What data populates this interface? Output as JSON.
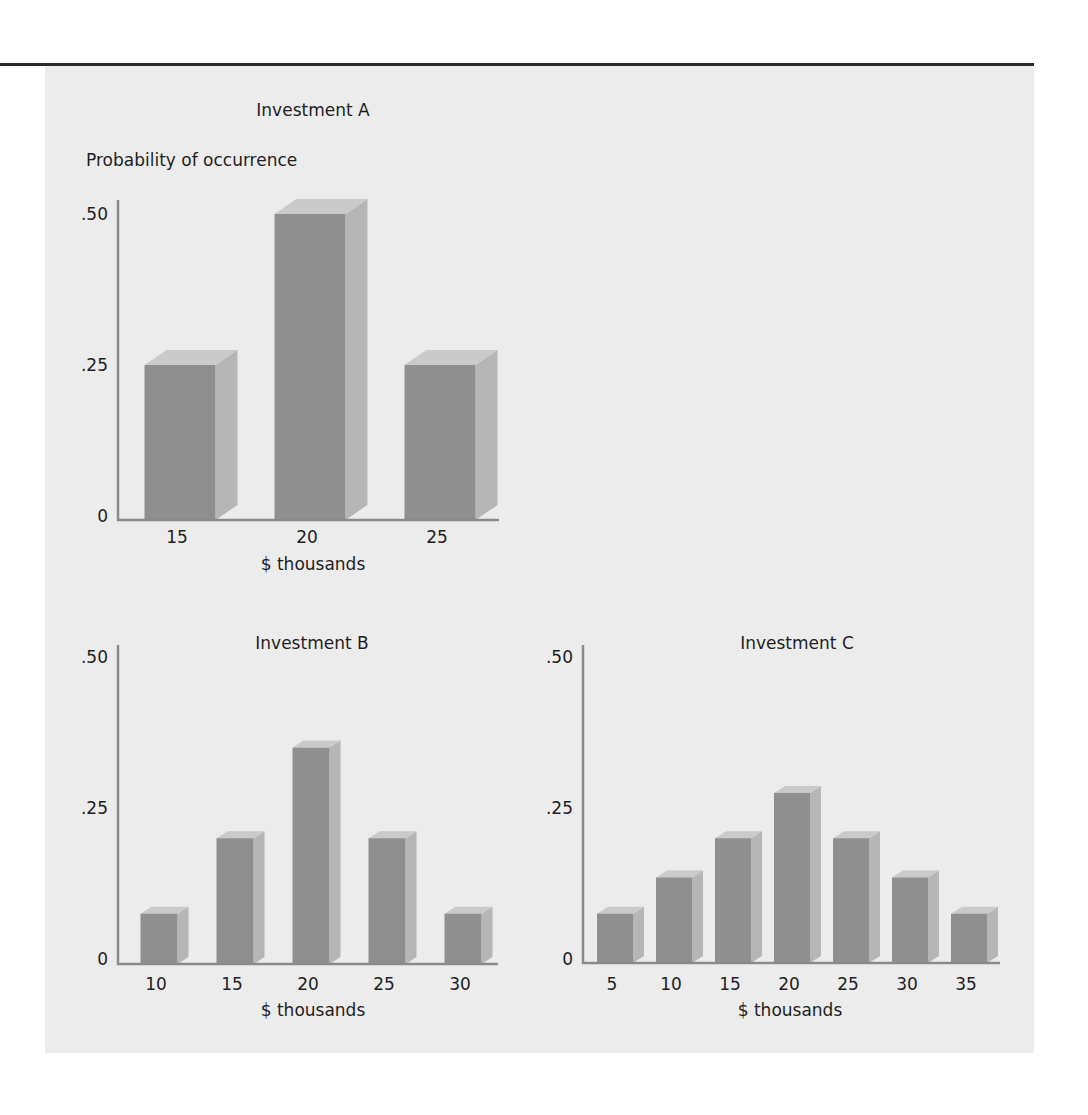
{
  "figure": {
    "y_axis_label": "Probability of occurrence",
    "colors": {
      "panel": "#ececec",
      "bar_front": "#8f8f8f",
      "bar_top": "#cacaca",
      "bar_side": "#b6b6b6",
      "axis": "#8a8a8a",
      "rule": "#2a2a2a"
    }
  },
  "chart_data": [
    {
      "type": "bar",
      "title": "Investment A",
      "xlabel": "$ thousands",
      "ylabel": "Probability of occurrence",
      "categories": [
        "15",
        "20",
        "25"
      ],
      "values": [
        0.25,
        0.5,
        0.25
      ],
      "yticks": [
        ".50",
        ".25",
        "0"
      ],
      "ylim": [
        0,
        0.5
      ],
      "grid": false,
      "style": "3d-bars"
    },
    {
      "type": "bar",
      "title": "Investment B",
      "xlabel": "$ thousands",
      "ylabel": "Probability of occurrence",
      "categories": [
        "10",
        "15",
        "20",
        "25",
        "30"
      ],
      "values": [
        0.075,
        0.2,
        0.35,
        0.2,
        0.075
      ],
      "yticks": [
        ".50",
        ".25",
        "0"
      ],
      "ylim": [
        0,
        0.5
      ],
      "grid": false,
      "style": "3d-bars"
    },
    {
      "type": "bar",
      "title": "Investment C",
      "xlabel": "$ thousands",
      "ylabel": "Probability of occurrence",
      "categories": [
        "5",
        "10",
        "15",
        "20",
        "25",
        "30",
        "35"
      ],
      "values": [
        0.075,
        0.135,
        0.2,
        0.275,
        0.2,
        0.135,
        0.075
      ],
      "yticks": [
        ".50",
        ".25",
        "0"
      ],
      "ylim": [
        0,
        0.5
      ],
      "grid": false,
      "style": "3d-bars"
    }
  ]
}
